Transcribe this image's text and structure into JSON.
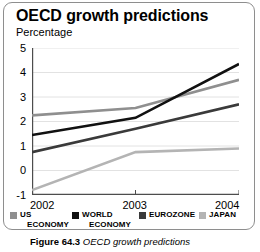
{
  "figure": {
    "caption_label": "Figure 64.3",
    "caption_text": "OECD growth predictions"
  },
  "chart_data": {
    "type": "line",
    "title": "OECD growth predictions",
    "subtitle": "Percentage",
    "xlabel": "",
    "ylabel": "Percentage",
    "categories": [
      "2002",
      "2003",
      "2004"
    ],
    "x": [
      2002,
      2003,
      2004
    ],
    "yticks": [
      5,
      4,
      3,
      2,
      1,
      0,
      -1
    ],
    "ytick_labels": [
      "5",
      "4",
      "3",
      "2",
      "1",
      "0",
      "-1"
    ],
    "ylim": [
      -1,
      5
    ],
    "grid": true,
    "grid_axis": "y",
    "legend_position": "bottom",
    "series": [
      {
        "name": "US ECONOMY",
        "legend_line1": "US",
        "legend_line2": "ECONOMY",
        "color": "#8f8f8f",
        "values": [
          2.25,
          2.55,
          3.7
        ]
      },
      {
        "name": "WORLD ECONOMY",
        "legend_line1": "WORLD",
        "legend_line2": "ECONOMY",
        "color": "#111111",
        "values": [
          1.45,
          2.15,
          4.35
        ]
      },
      {
        "name": "EUROZONE",
        "legend_line1": "EUROZONE",
        "legend_line2": "",
        "color": "#3a3a3a",
        "values": [
          0.75,
          1.7,
          2.7
        ]
      },
      {
        "name": "JAPAN",
        "legend_line1": "JAPAN",
        "legend_line2": "",
        "color": "#b4b4b4",
        "values": [
          -0.8,
          0.75,
          0.9
        ]
      }
    ]
  },
  "colors": {
    "frame_border": "#8e8e8e",
    "axis": "#4d4d4d",
    "gridline": "#e2e2e2",
    "text": "#000000"
  }
}
